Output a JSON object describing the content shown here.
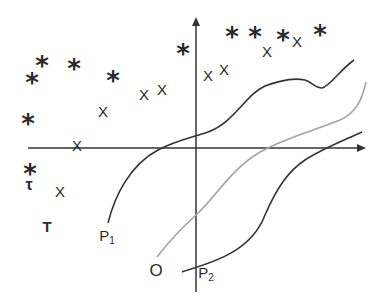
{
  "diagram": {
    "axes": {
      "origin": [
        196,
        148
      ],
      "x_axis": {
        "from": [
          28,
          148
        ],
        "to": [
          366,
          148
        ],
        "arrow": true
      },
      "y_axis": {
        "from": [
          196,
          292
        ],
        "to": [
          196,
          18
        ],
        "arrow": true
      },
      "color": "#333333"
    },
    "stars": [
      {
        "x": 28,
        "y": 121
      },
      {
        "x": 32,
        "y": 79
      },
      {
        "x": 42,
        "y": 62
      },
      {
        "x": 74,
        "y": 65
      },
      {
        "x": 113,
        "y": 77
      },
      {
        "x": 183,
        "y": 50
      },
      {
        "x": 232,
        "y": 33
      },
      {
        "x": 255,
        "y": 33
      },
      {
        "x": 283,
        "y": 36
      },
      {
        "x": 320,
        "y": 31
      },
      {
        "x": 30,
        "y": 170
      }
    ],
    "crosses": [
      {
        "x": 77,
        "y": 145
      },
      {
        "x": 103,
        "y": 111
      },
      {
        "x": 144,
        "y": 94
      },
      {
        "x": 162,
        "y": 89
      },
      {
        "x": 208,
        "y": 75
      },
      {
        "x": 224,
        "y": 69
      },
      {
        "x": 267,
        "y": 51
      },
      {
        "x": 297,
        "y": 41
      },
      {
        "x": 60,
        "y": 191
      }
    ],
    "labels": {
      "tau": "τ",
      "T": "T",
      "P1_main": "P",
      "P1_sub": "1",
      "O": "O",
      "P2_main": "P",
      "P2_sub": "2"
    },
    "curves": {
      "P1": {
        "color": "#333333",
        "desc": "dark curve from P1 rising through axis, bump near top right"
      },
      "O": {
        "color": "#a0a0a0",
        "desc": "gray curve from O rising to upper right"
      },
      "P2": {
        "color": "#333333",
        "desc": "dark curve from P2 rising to lower right"
      }
    }
  }
}
